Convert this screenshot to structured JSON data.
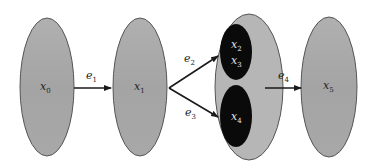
{
  "nodes": [
    {
      "id": "x0",
      "label": "x",
      "sub": "0"
    },
    {
      "id": "x1",
      "label": "x",
      "sub": "1"
    },
    {
      "id": "x2",
      "label": "x",
      "sub": "2"
    },
    {
      "id": "x3",
      "label": "x",
      "sub": "3"
    },
    {
      "id": "x4",
      "label": "x",
      "sub": "4"
    },
    {
      "id": "x5",
      "label": "x",
      "sub": "5"
    }
  ],
  "edges": [
    {
      "id": "e1",
      "label": "e",
      "sub": "1",
      "from": "x0",
      "to": "x1"
    },
    {
      "id": "e2",
      "label": "e",
      "sub": "2",
      "from": "x1",
      "to": "x2,x3"
    },
    {
      "id": "e3",
      "label": "e",
      "sub": "3",
      "from": "x1",
      "to": "x4"
    },
    {
      "id": "e4",
      "label": "e",
      "sub": "4",
      "from": "x2,x3,x4",
      "to": "x5"
    }
  ],
  "colors": {
    "node_fill": "#a8a8a8",
    "group_fill": "#b4b4b4",
    "inner_fill": "#0a0a0a",
    "stroke": "#444444",
    "arrow": "#1a1a1a"
  }
}
